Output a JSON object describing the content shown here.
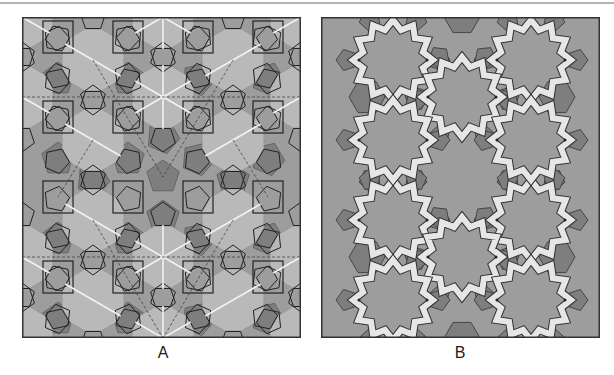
{
  "figure": {
    "panels": [
      {
        "id": "A",
        "label": "A",
        "description": "Underlying polygonal tessellation: twelve-fold rosettes with radial white lines and dashed construction lines, overlaid with squares and pentagons"
      },
      {
        "id": "B",
        "label": "B",
        "description": "Resulting geometric pattern: white interlaced strapwork bands forming twelve-pointed stars, with darker pentagons and hexagons"
      }
    ]
  },
  "colors": {
    "rosette_light": "#b9b9b9",
    "background_mid": "#9d9d9d",
    "polygon_dark": "#7e7e7e",
    "line_dark": "#222222",
    "band_white": "#e6e6e6",
    "spoke_white": "#f2f2f2",
    "top_rule": "#b4b4b4"
  }
}
